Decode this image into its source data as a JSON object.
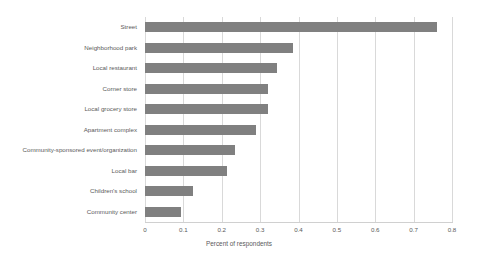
{
  "chart_data": {
    "type": "bar",
    "orientation": "horizontal",
    "title": "",
    "xlabel": "Percent of respondents",
    "ylabel": "",
    "xlim": [
      0,
      0.8
    ],
    "xticks": [
      "0",
      "0.1",
      "0.2",
      "0.3",
      "0.4",
      "0.5",
      "0.6",
      "0.7",
      "0.8"
    ],
    "xtick_values": [
      0,
      0.1,
      0.2,
      0.3,
      0.4,
      0.5,
      0.6,
      0.7,
      0.8
    ],
    "grid": "vertical",
    "legend": "none",
    "bar_color": "#808080",
    "gridline_color": "#d9d9d9",
    "text_color": "#5a5a5a",
    "categories": [
      "Street",
      "Neighborhood park",
      "Local restaurant",
      "Corner store",
      "Local grocery store",
      "Apartment complex",
      "Community-sponsored event/organization",
      "Local bar",
      "Children's school",
      "Community center"
    ],
    "values": [
      0.76,
      0.385,
      0.345,
      0.32,
      0.32,
      0.29,
      0.234,
      0.214,
      0.125,
      0.095
    ]
  }
}
